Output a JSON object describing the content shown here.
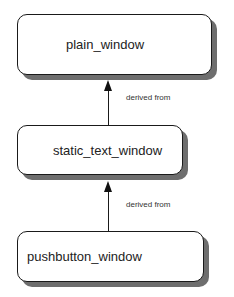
{
  "diagram": {
    "type": "inheritance-hierarchy",
    "nodes": [
      {
        "id": "plain_window",
        "label": "plain_window"
      },
      {
        "id": "static_text_window",
        "label": "static_text_window"
      },
      {
        "id": "pushbutton_window",
        "label": "pushbutton_window"
      }
    ],
    "edges": [
      {
        "from": "static_text_window",
        "to": "plain_window",
        "label": "derived from"
      },
      {
        "from": "pushbutton_window",
        "to": "static_text_window",
        "label": "derived from"
      }
    ],
    "colors": {
      "box_fill": "#ffffff",
      "box_border": "#1a1a1a",
      "shadow": "#6e6e6e",
      "arrow": "#111111"
    }
  }
}
